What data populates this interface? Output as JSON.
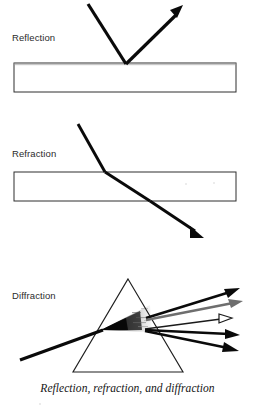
{
  "figure": {
    "title": "Reflection, refraction, and diffraction",
    "caption": "Reflection, refraction, and diffraction",
    "background_color": "#ffffff",
    "ink_color": "#0a0a0a",
    "gray_ray_color": "#6e6e6e",
    "outline_color": "#2e2e2e",
    "width": 255,
    "height": 410
  },
  "panels": [
    {
      "id": "reflection",
      "label": "Reflection",
      "label_x": 12,
      "label_y": 41,
      "medium": {
        "name": "speckled-slab",
        "x": 14,
        "y": 63,
        "width": 222,
        "height": 29,
        "texture": "speckled"
      },
      "rays": [
        {
          "name": "incident-ray",
          "kind": "incident",
          "arrowhead": "none",
          "head_style": "solid",
          "points": "88,4 126,63"
        },
        {
          "name": "reflected-ray",
          "kind": "reflected",
          "arrowhead": "end",
          "head_style": "solid",
          "points": "126,63 180,10"
        }
      ]
    },
    {
      "id": "refraction",
      "label": "Refraction",
      "label_x": 12,
      "label_y": 157,
      "medium": {
        "name": "clear-slab",
        "x": 14,
        "y": 172,
        "width": 222,
        "height": 29,
        "texture": "clear"
      },
      "rays": [
        {
          "name": "incident-ray",
          "kind": "incident",
          "arrowhead": "none",
          "head_style": "solid",
          "points": "78,124 105,172"
        },
        {
          "name": "internal-ray",
          "kind": "refracted-internal",
          "arrowhead": "none",
          "head_style": "solid",
          "points": "105,172 150,201"
        },
        {
          "name": "emergent-ray",
          "kind": "refracted-exit",
          "arrowhead": "end",
          "head_style": "solid",
          "points": "150,201 200,235"
        }
      ]
    },
    {
      "id": "diffraction",
      "label": "Diffraction",
      "label_x": 12,
      "label_y": 299,
      "medium": {
        "name": "prism",
        "apex_x": 128,
        "apex_y": 279,
        "base_left_x": 73,
        "base_right_x": 183,
        "base_y": 372,
        "texture": "clear"
      },
      "rays": [
        {
          "name": "incident-ray",
          "kind": "incident",
          "arrowhead": "none",
          "head_style": "solid",
          "points": "20,360 101,330"
        },
        {
          "name": "emergent-ray-1",
          "kind": "dispersed",
          "arrowhead": "end",
          "head_style": "solid",
          "points": "146,318 238,290"
        },
        {
          "name": "emergent-ray-2",
          "kind": "dispersed",
          "arrowhead": "end",
          "head_style": "gray",
          "points": "146,320 241,302"
        },
        {
          "name": "emergent-ray-3",
          "kind": "dispersed",
          "arrowhead": "end",
          "head_style": "hollow",
          "points": "145,329 230,317"
        },
        {
          "name": "emergent-ray-4",
          "kind": "dispersed",
          "arrowhead": "end",
          "head_style": "solid",
          "points": "145,330 238,335"
        },
        {
          "name": "emergent-ray-5",
          "kind": "dispersed",
          "arrowhead": "end",
          "head_style": "solid",
          "points": "145,331 238,350"
        }
      ],
      "dispersion_wedge": {
        "name": "dispersion-fan",
        "description": "dark graded fan spreading from entry point toward exit face"
      }
    }
  ]
}
